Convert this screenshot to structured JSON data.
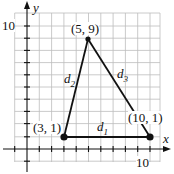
{
  "figure": {
    "axes": {
      "x_label": "x",
      "y_label": "y",
      "x_tick_label": "10",
      "y_tick_label": "10"
    },
    "points": [
      {
        "label": "(3, 1)",
        "x": 3,
        "y": 1
      },
      {
        "label": "(10, 1)",
        "x": 10,
        "y": 1
      },
      {
        "label": "(5, 9)",
        "x": 5,
        "y": 9
      }
    ],
    "segments": [
      {
        "name": "d",
        "sub": "1",
        "from": "(3, 1)",
        "to": "(10, 1)"
      },
      {
        "name": "d",
        "sub": "2",
        "from": "(3, 1)",
        "to": "(5, 9)"
      },
      {
        "name": "d",
        "sub": "3",
        "from": "(5, 9)",
        "to": "(10, 1)"
      }
    ],
    "colors": {
      "line": "#111111",
      "grid": "#bbbbbb",
      "background": "#ffffff"
    }
  }
}
